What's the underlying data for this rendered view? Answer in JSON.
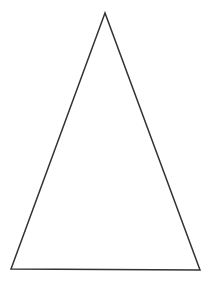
{
  "diagram": {
    "shape": "triangle",
    "stroke_color": "#333333",
    "fill_color": "#ffffff",
    "stroke_width": 1.5,
    "points": "105,13 11,269 200,270"
  }
}
